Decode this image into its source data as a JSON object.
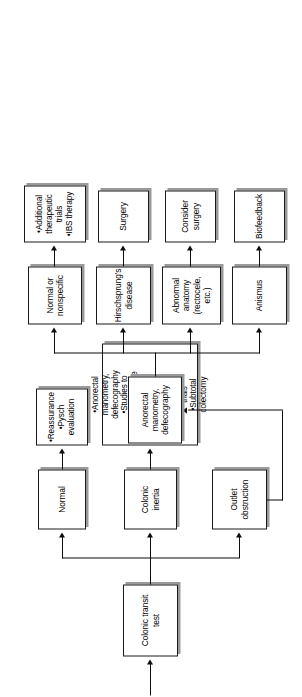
{
  "figure": {
    "type": "flowchart",
    "orientation": "rotated-90-ccw"
  },
  "nodes": {
    "colonic_transit_test": "Colonic transit\ntest",
    "normal": "Normal",
    "colonic_inertia": "Colonic\ninertia",
    "outlet_obstruction": "Outlet\nobstruction",
    "normal_treatment": "•Reassurance\n•Pysch\nevaluation",
    "inertia_treatment": "•Anorectal\nmanometry,\ndefecography\n•Studies to\nR/O a diffuse\nGI motility\ndisorder\n•Extensive\ntherapeutic\ntrials\n•Subtotal\ncolectomy",
    "anorectal_manometry": "Anorectal manometry,\ndefecography",
    "anismus": "Anismus",
    "abnormal_anatomy": "Abnormal\nanatomy\n(rectocele, etc.)",
    "hirschsprungs": "Hirschsprung's\ndisease",
    "normal_or_nonspecific": "Normal or\nnonspecific",
    "biofeedback": "Biofeedback",
    "consider_surgery": "Consider\nsurgery",
    "surgery": "Surgery",
    "nonspecific_treatment": "•Additional\ntherapeutic\ntrials\n•IBS therapy"
  },
  "colors": {
    "box_border": "#1a1a1a",
    "box_fill": "#ffffff",
    "box_shadow": "#9a9a9a",
    "line": "#0d0d0d",
    "text": "#000000",
    "background": "#ffffff"
  }
}
